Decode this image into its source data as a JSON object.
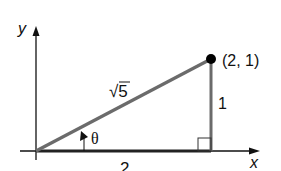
{
  "diagram": {
    "type": "right-triangle-on-axes",
    "axes": {
      "x_label": "x",
      "y_label": "y"
    },
    "point": {
      "label": "(2, 1)",
      "x": 2,
      "y": 1
    },
    "sides": {
      "hypotenuse": "√5",
      "opposite": "1",
      "adjacent": "2"
    },
    "angle": {
      "label": "θ"
    },
    "colors": {
      "axis": "#111111",
      "hypotenuse": "#6b6b6b",
      "vertical_side": "#6b6b6b",
      "point": "#000000"
    }
  }
}
